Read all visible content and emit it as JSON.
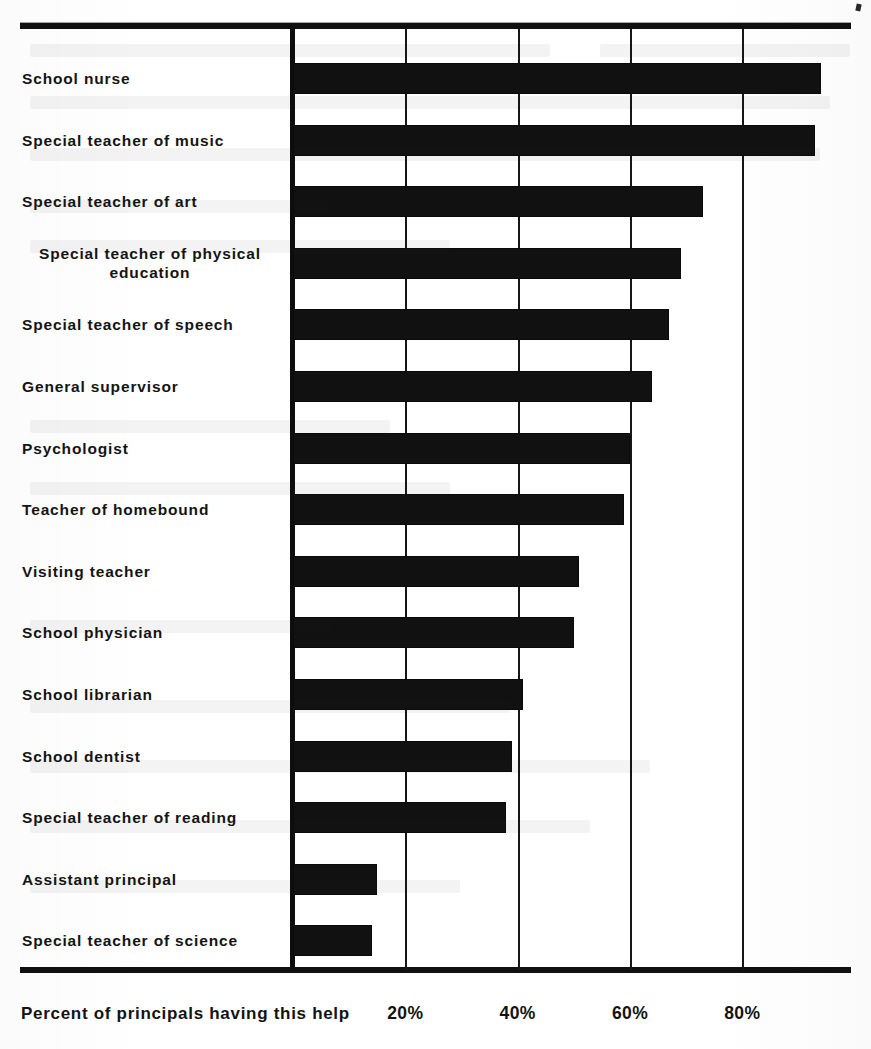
{
  "page": {
    "background_color": "#ffffff",
    "ink_color": "#111111",
    "has_top_rule": true,
    "has_bottom_rule": true
  },
  "chart_data": {
    "type": "bar",
    "orientation": "horizontal",
    "title": "",
    "subtitle": "",
    "xlabel": "Percent of principals having this help",
    "ylabel": "",
    "xlim": [
      0,
      99
    ],
    "ylim": null,
    "grid": true,
    "grid_axis": "x",
    "legend": false,
    "legend_position": "none",
    "bar_color": "#111111",
    "x_tick_values": [
      20,
      40,
      60,
      80
    ],
    "x_tick_labels": [
      "20%",
      "40%",
      "60%",
      "80%"
    ],
    "categories": [
      "School nurse",
      "Special teacher of music",
      "Special teacher of art",
      "Special teacher of physical education",
      "Special teacher of speech",
      "General supervisor",
      "Psychologist",
      "Teacher of homebound",
      "Visiting teacher",
      "School physician",
      "School librarian",
      "School dentist",
      "Special teacher of reading",
      "Assistant principal",
      "Special teacher of science"
    ],
    "category_label_lines": [
      [
        "School nurse"
      ],
      [
        "Special teacher of music"
      ],
      [
        "Special teacher of art"
      ],
      [
        "Special teacher of physical",
        "education"
      ],
      [
        "Special teacher of speech"
      ],
      [
        "General supervisor"
      ],
      [
        "Psychologist"
      ],
      [
        "Teacher of homebound"
      ],
      [
        "Visiting teacher"
      ],
      [
        "School physician"
      ],
      [
        "School librarian"
      ],
      [
        "School dentist"
      ],
      [
        "Special teacher of reading"
      ],
      [
        "Assistant principal"
      ],
      [
        "Special teacher of science"
      ]
    ],
    "values": [
      94,
      93,
      73,
      69,
      67,
      64,
      60,
      59,
      51,
      50,
      41,
      39,
      38,
      15,
      14
    ],
    "value_unit": "%"
  },
  "axis": {
    "caption": "Percent of principals having this help"
  }
}
